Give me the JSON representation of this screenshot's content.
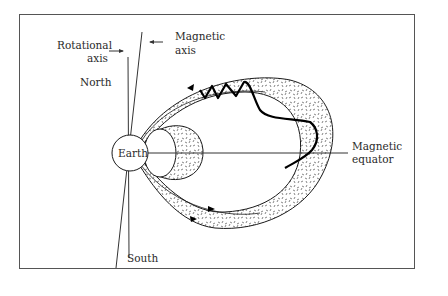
{
  "figure": {
    "type": "Earth magnetosphere radiation belts diagram",
    "labels": {
      "rotational_axis": [
        "Rotational",
        "axis"
      ],
      "magnetic_axis": [
        "Magnetic",
        "axis"
      ],
      "north": "North",
      "south": "South",
      "earth": "Earth",
      "magnetic_equator": [
        "Magnetic",
        "equator"
      ]
    },
    "elements": [
      "frame",
      "earth-circle",
      "rotational-axis-line",
      "magnetic-axis-line",
      "magnetic-equator-line",
      "inner-radiation-belt",
      "outer-radiation-belt",
      "particle-trajectory",
      "field-line-arrows"
    ],
    "colors": {
      "stroke": "#1a1a1a",
      "background": "#ffffff",
      "frame": "#555555"
    }
  }
}
